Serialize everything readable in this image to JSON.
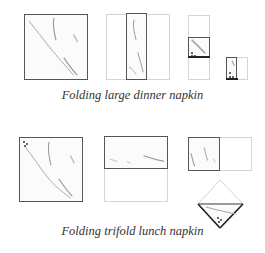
{
  "figure": {
    "row1": {
      "caption": "Folding large dinner napkin",
      "steps": [
        "unfolded square",
        "folded into thirds lengthwise",
        "folded in half",
        "folded in half again"
      ]
    },
    "row2": {
      "caption": "Folding trifold lunch napkin",
      "steps": [
        "unfolded square with corner mark",
        "folded in half",
        "folded in half again",
        "rotated to diamond"
      ]
    }
  },
  "colors": {
    "outline_dark": "#555555",
    "outline_faint": "#d4d4d4",
    "texture": "#9a9a9a",
    "caption": "#333333"
  }
}
